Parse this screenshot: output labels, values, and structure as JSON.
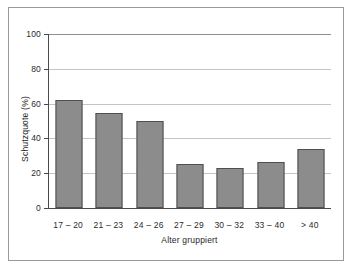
{
  "chart_data": {
    "type": "bar",
    "title": "",
    "xlabel": "Alter gruppiert",
    "ylabel": "Schutzquote (%)",
    "categories": [
      "17 – 20",
      "21 – 23",
      "24 – 26",
      "27 – 29",
      "30 – 32",
      "33 – 40",
      "> 40"
    ],
    "values": [
      62,
      54.5,
      50,
      25.5,
      23,
      26.5,
      34
    ],
    "ylim": [
      0,
      100
    ],
    "yticks": [
      0,
      20,
      40,
      60,
      80,
      100
    ],
    "ytick_labels": [
      "0",
      "20",
      "40",
      "60",
      "80",
      "100"
    ],
    "grid": "horizontal",
    "legend": "none",
    "bar_color": "#8c8c8c",
    "bar_edge_color": "#4f4f4f",
    "grid_color": "#c4c4c4",
    "axis_color": "#4a4a4a",
    "frame_color": "#9a9a9a",
    "background": "#ffffff"
  }
}
